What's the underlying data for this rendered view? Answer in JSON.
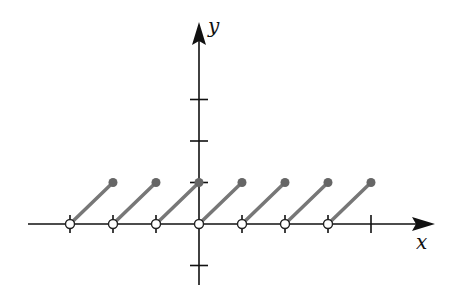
{
  "axes": {
    "x_label": "x",
    "y_label": "y",
    "axis_color": "#111111"
  },
  "colors": {
    "segment": "#777777",
    "closed_dot": "#666666",
    "open_dot_fill": "#ffffff",
    "open_dot_stroke": "#222222"
  },
  "chart_data": {
    "type": "line",
    "title": "",
    "xlabel": "x",
    "ylabel": "y",
    "xlim": [
      -3.1,
      5.5
    ],
    "ylim": [
      -1.2,
      3.0
    ],
    "x_ticks": [
      -3,
      -2,
      -1,
      1,
      2,
      3,
      4
    ],
    "y_ticks": [
      -1,
      1,
      2,
      3
    ],
    "segments": [
      {
        "from": [
          -3,
          0
        ],
        "to": [
          -2,
          1
        ],
        "start": "open",
        "end": "closed"
      },
      {
        "from": [
          -2,
          0
        ],
        "to": [
          -1,
          1
        ],
        "start": "open",
        "end": "closed"
      },
      {
        "from": [
          -1,
          0
        ],
        "to": [
          0,
          1
        ],
        "start": "open",
        "end": "closed"
      },
      {
        "from": [
          0,
          0
        ],
        "to": [
          1,
          1
        ],
        "start": "open",
        "end": "closed"
      },
      {
        "from": [
          1,
          0
        ],
        "to": [
          2,
          1
        ],
        "start": "open",
        "end": "closed"
      },
      {
        "from": [
          2,
          0
        ],
        "to": [
          3,
          1
        ],
        "start": "open",
        "end": "closed"
      },
      {
        "from": [
          3,
          0
        ],
        "to": [
          4,
          1
        ],
        "start": "open",
        "end": "closed"
      }
    ]
  }
}
